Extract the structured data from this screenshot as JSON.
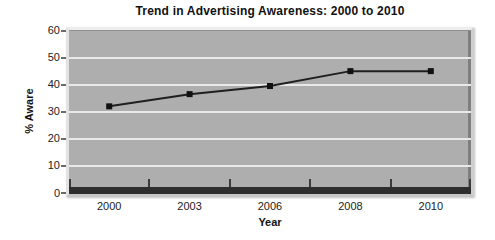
{
  "chart_data": {
    "type": "line",
    "title": "Trend in Advertising Awareness: 2000 to 2010",
    "xlabel": "Year",
    "ylabel": "% Aware",
    "categories": [
      "2000",
      "2003",
      "2006",
      "2008",
      "2010"
    ],
    "series": [
      {
        "name": "% Aware",
        "values": [
          32,
          36.5,
          39.5,
          45,
          45
        ]
      }
    ],
    "ylim": [
      0,
      60
    ],
    "yticks": [
      0,
      10,
      20,
      30,
      40,
      50,
      60
    ],
    "grid": "horizontal",
    "legend": "none",
    "marker": "square",
    "colors": {
      "series_line": "#1f1f1f",
      "marker": "#111111",
      "plot_background": "#aeaeae",
      "gridline": "#e9e9e9",
      "axis_band": "#2e2e2e",
      "text": "#1a1a1a",
      "page_background": "#ffffff"
    }
  }
}
